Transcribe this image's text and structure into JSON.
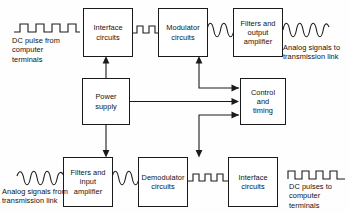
{
  "diagram": {
    "background_color": "#fefefe",
    "line_color": "#1a1a1a",
    "boxes": [
      {
        "id": "interface_tx",
        "lines": [
          "Interface",
          "circuits"
        ],
        "x": 83,
        "y": 8,
        "w": 50,
        "h": 49
      },
      {
        "id": "modulator",
        "lines": [
          "Modulator",
          "circuits"
        ],
        "x": 158,
        "y": 8,
        "w": 50,
        "h": 49
      },
      {
        "id": "filters_output",
        "lines": [
          "Filters and",
          "output",
          "amplifier"
        ],
        "x": 233,
        "y": 8,
        "w": 50,
        "h": 49
      },
      {
        "id": "power_supply",
        "lines": [
          "Power",
          "supply"
        ],
        "x": 82,
        "y": 78,
        "w": 48,
        "h": 47
      },
      {
        "id": "control_timing",
        "lines": [
          "Control",
          "and",
          "timing"
        ],
        "x": 240,
        "y": 78,
        "w": 46,
        "h": 47
      },
      {
        "id": "filters_input",
        "lines": [
          "Filters and",
          "input",
          "amplifier"
        ],
        "x": 63,
        "y": 157,
        "w": 50,
        "h": 50
      },
      {
        "id": "demodulator",
        "lines": [
          "Demodulator",
          "circuits"
        ],
        "x": 138,
        "y": 157,
        "w": 50,
        "h": 50
      },
      {
        "id": "interface_rx",
        "lines": [
          "Interface",
          "circuits"
        ],
        "x": 228,
        "y": 157,
        "w": 50,
        "h": 50
      }
    ],
    "captions": [
      {
        "id": "dc_pulse_from",
        "lines": [
          "DC pulse from",
          "computer",
          "terminals"
        ],
        "x": 12,
        "y": 36
      },
      {
        "id": "analog_to",
        "lines": [
          "Analog signals to",
          "transmission link"
        ],
        "x": 285,
        "y": 44
      },
      {
        "id": "analog_from",
        "lines": [
          "Analog signals from",
          "transmission link"
        ],
        "x": 3,
        "y": 186
      },
      {
        "id": "dc_pulses_to",
        "lines": [
          "DC pulses to",
          "computer",
          "terminals"
        ],
        "x": 288,
        "y": 183
      }
    ],
    "waveforms": [
      {
        "id": "square-wave-input",
        "type": "square",
        "x": 14,
        "y": 22,
        "w": 66,
        "h": 12,
        "cycles": 4
      },
      {
        "id": "square-wave-interface-to-modulator",
        "type": "square",
        "x": 134,
        "y": 24,
        "w": 24,
        "h": 11,
        "cycles": 2
      },
      {
        "id": "sine-wave-modulator-to-filters",
        "type": "sine",
        "x": 208,
        "y": 22,
        "w": 26,
        "h": 16,
        "cycles": 2
      },
      {
        "id": "sine-wave-output",
        "type": "sine",
        "x": 284,
        "y": 22,
        "w": 44,
        "h": 16,
        "cycles": 3
      },
      {
        "id": "sine-wave-input",
        "type": "sine",
        "x": 18,
        "y": 170,
        "w": 46,
        "h": 16,
        "cycles": 3
      },
      {
        "id": "sine-wave-filters-to-demodulator",
        "type": "sine",
        "x": 113,
        "y": 170,
        "w": 26,
        "h": 16,
        "cycles": 2
      },
      {
        "id": "square-wave-demodulator-to-interface",
        "type": "square",
        "x": 188,
        "y": 172,
        "w": 41,
        "h": 11,
        "cycles": 2
      },
      {
        "id": "square-wave-output",
        "type": "square",
        "x": 288,
        "y": 170,
        "w": 56,
        "h": 12,
        "cycles": 4
      }
    ],
    "connectors": [
      {
        "id": "power-to-interface-tx",
        "from": "power_supply",
        "to": "interface_tx",
        "shape": "vertical-up"
      },
      {
        "id": "power-to-filters-input",
        "from": "power_supply",
        "to": "filters_input",
        "shape": "vertical-down"
      },
      {
        "id": "power-to-control",
        "from": "power_supply",
        "to": "control_timing",
        "shape": "horizontal"
      },
      {
        "id": "control-to-modulator",
        "from": "control_timing",
        "to": "modulator",
        "shape": "elbow-up"
      },
      {
        "id": "control-to-demodulator",
        "from": "control_timing",
        "to": "demodulator",
        "shape": "elbow-down"
      }
    ]
  }
}
